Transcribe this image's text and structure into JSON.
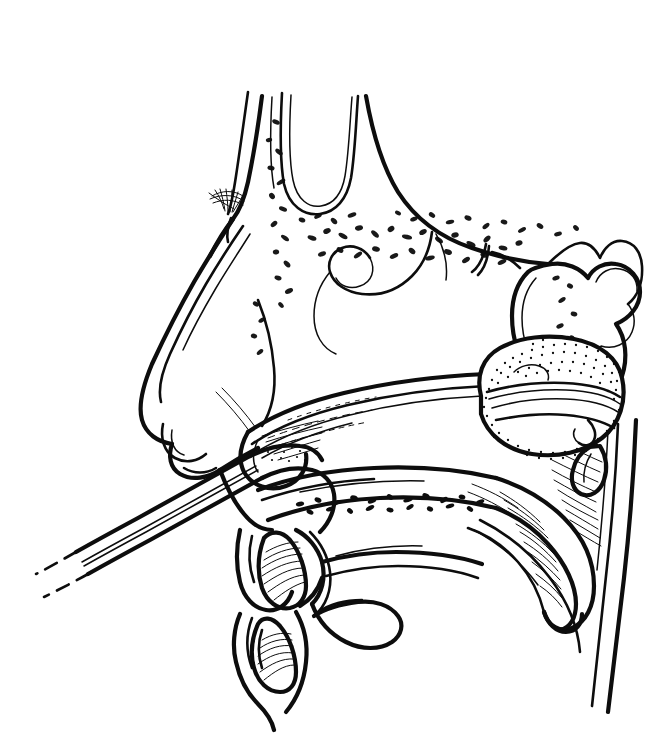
{
  "figure": {
    "panel_label": "C",
    "kind": "line-drawing",
    "background_color": "#ffffff",
    "ink_color": "#0d0d0d",
    "width": 665,
    "height": 736
  },
  "structures": [
    {
      "id": "forehead-glabella",
      "name": "forehead and glabella contour"
    },
    {
      "id": "eyebrow-hairs",
      "name": "eyebrow hair strokes"
    },
    {
      "id": "frontal-sinus",
      "name": "frontal sinus cavity"
    },
    {
      "id": "cancellous-bone",
      "name": "cancellous (diploic) bone stipple"
    },
    {
      "id": "nasal-dorsum",
      "name": "nasal dorsum and tip"
    },
    {
      "id": "nasal-ala-columella",
      "name": "nasal ala and columella"
    },
    {
      "id": "nostril-opening",
      "name": "nostril (anterior naris)"
    },
    {
      "id": "middle-turbinate",
      "name": "middle turbinate"
    },
    {
      "id": "inferior-turbinate",
      "name": "inferior turbinate"
    },
    {
      "id": "nasal-cavity",
      "name": "nasal cavity airway"
    },
    {
      "id": "sphenoid-sinus",
      "name": "sphenoid sinus"
    },
    {
      "id": "sella-clivus",
      "name": "sella turcica and clivus outline"
    },
    {
      "id": "balloon-pack",
      "name": "inflated posterior nasal balloon pack"
    },
    {
      "id": "balloon-tie",
      "name": "balloon tie / retention hook"
    },
    {
      "id": "catheter-tube",
      "name": "balloon catheter tube through nostril"
    },
    {
      "id": "catheter-dashed-tail",
      "name": "catheter continuation (dashed)"
    },
    {
      "id": "hard-palate",
      "name": "hard palate"
    },
    {
      "id": "soft-palate",
      "name": "soft palate with muscle hatching"
    },
    {
      "id": "uvula",
      "name": "uvula"
    },
    {
      "id": "upper-incisor",
      "name": "upper incisor tooth"
    },
    {
      "id": "lower-incisor",
      "name": "lower incisor tooth"
    },
    {
      "id": "upper-lip",
      "name": "upper lip"
    },
    {
      "id": "lower-lip-chin",
      "name": "lower lip and chin"
    },
    {
      "id": "tongue",
      "name": "tongue"
    },
    {
      "id": "oral-cavity",
      "name": "oral cavity"
    },
    {
      "id": "pharyngeal-wall",
      "name": "posterior pharyngeal wall"
    },
    {
      "id": "nasopharynx",
      "name": "nasopharynx"
    }
  ]
}
